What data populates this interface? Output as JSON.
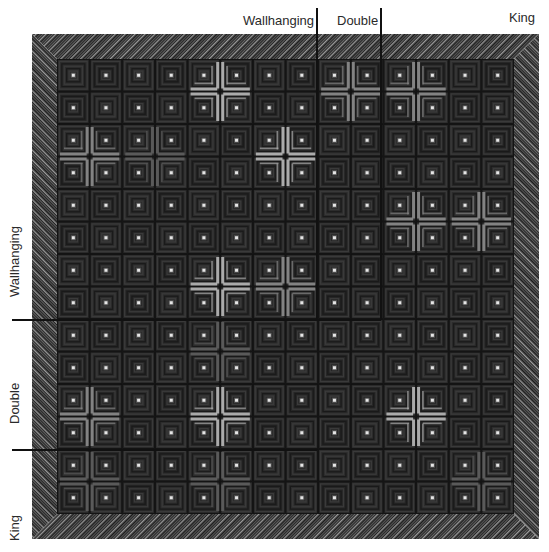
{
  "figure": {
    "width": 549,
    "height": 552
  },
  "quilt": {
    "outer": {
      "x": 32,
      "y": 34,
      "w": 507,
      "h": 505
    },
    "border_width": 25,
    "grid": {
      "cols": 14,
      "rows": 14
    },
    "colors": {
      "background": "#1e1e1e",
      "block_dark": "#262626",
      "block_mid": "#3a3a3a",
      "strip_light": "#6e6e6e",
      "strip_bright": "#b8b8b8",
      "center": "#e6e6e6",
      "border_base": "#1c1c1c",
      "border_stripe_a": "#8a8a8a",
      "border_stripe_b": "#4a4a4a",
      "marker": "#111111"
    },
    "highlights": [
      {
        "col": 4,
        "row": 0,
        "level": "bright"
      },
      {
        "col": 8,
        "row": 0,
        "level": "medium"
      },
      {
        "col": 10,
        "row": 0,
        "level": "medium"
      },
      {
        "col": 0,
        "row": 2,
        "level": "medium"
      },
      {
        "col": 2,
        "row": 2,
        "level": "faint"
      },
      {
        "col": 6,
        "row": 2,
        "level": "bright"
      },
      {
        "col": 10,
        "row": 4,
        "level": "medium"
      },
      {
        "col": 12,
        "row": 4,
        "level": "medium"
      },
      {
        "col": 4,
        "row": 6,
        "level": "bright"
      },
      {
        "col": 6,
        "row": 6,
        "level": "medium"
      },
      {
        "col": 4,
        "row": 8,
        "level": "faint"
      },
      {
        "col": 0,
        "row": 10,
        "level": "medium"
      },
      {
        "col": 4,
        "row": 10,
        "level": "bright"
      },
      {
        "col": 10,
        "row": 10,
        "level": "bright"
      },
      {
        "col": 0,
        "row": 12,
        "level": "faint"
      },
      {
        "col": 4,
        "row": 12,
        "level": "faint"
      },
      {
        "col": 12,
        "row": 12,
        "level": "faint"
      }
    ]
  },
  "labels": {
    "top": [
      {
        "text": "Wallhanging",
        "x": 243,
        "y": 14
      },
      {
        "text": "Double",
        "x": 337,
        "y": 14
      },
      {
        "text": "King",
        "x": 509,
        "y": 11
      }
    ],
    "left": [
      {
        "text": "Wallhanging",
        "x": 8,
        "y": 297
      },
      {
        "text": "Double",
        "x": 8,
        "y": 424
      },
      {
        "text": "King",
        "x": 8,
        "y": 541
      }
    ]
  },
  "markers": {
    "vertical": [
      {
        "x": 317,
        "y1": 8,
        "y2": 320
      },
      {
        "x": 381,
        "y1": 8,
        "y2": 320
      }
    ],
    "horizontal": [
      {
        "y": 320,
        "x1": 12,
        "x2": 381
      },
      {
        "y": 450,
        "x1": 12,
        "x2": 317
      }
    ]
  }
}
